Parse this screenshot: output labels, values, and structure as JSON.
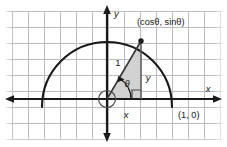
{
  "figure": {
    "type": "geometry-diagram",
    "background_color": "#ffffff",
    "grid": {
      "visible": true,
      "color": "#b9b9bd",
      "spacing_px": 16,
      "x_start_px": 12,
      "y_start_px": 11,
      "columns": 13,
      "rows": 8,
      "edge_fade": true
    },
    "axes": {
      "color": "#1a1a1a",
      "x_axis": {
        "label": "x",
        "y_px": 99,
        "x_from_px": 6,
        "x_to_px": 221,
        "arrow_left": true,
        "arrow_right": true,
        "label_x_px": 208,
        "label_y_px": 89
      },
      "y_axis": {
        "label": "y",
        "x_px": 107,
        "y_from_px": 6,
        "y_to_px": 141,
        "arrow_up": true,
        "arrow_down": true,
        "label_x_px": 113,
        "label_y_px": 14
      }
    },
    "semicircle": {
      "description": "upper half of the unit circle centered at the origin",
      "center_x_px": 107,
      "center_y_px": 99,
      "radius_px": 65,
      "stroke_color": "#1a1a1a",
      "stroke_width_px": 2,
      "overshoot_below_axis_px": 9
    },
    "origin_marker": {
      "shape": "small-circle",
      "center_x_px": 107,
      "center_y_px": 99,
      "radius_px": 9,
      "stroke_color": "#4a4a4a"
    },
    "triangle": {
      "description": "right triangle with hypotenuse of length 1 from origin to point on circle",
      "fill_color": "#d2d2d2",
      "stroke_color": "#4a4a4a",
      "vertices_px": [
        [
          107,
          99
        ],
        [
          141,
          99
        ],
        [
          141,
          41
        ]
      ],
      "angle_deg": 60
    },
    "point_on_circle": {
      "label": "(cosθ, sinθ)",
      "x_px": 141,
      "y_px": 41,
      "marker": "filled-dot",
      "marker_radius_px": 2.6,
      "label_x_px": 137,
      "label_y_px": 25
    },
    "x_intercept": {
      "label": "(1, 0)",
      "label_x_px": 178,
      "label_y_px": 115
    },
    "labels": {
      "hypotenuse": {
        "text": "1",
        "x_px": 118,
        "y_px": 63
      },
      "opposite_side": {
        "text": "y",
        "x_px": 148,
        "y_px": 78
      },
      "adjacent_side": {
        "text": "x",
        "x_px": 126,
        "y_px": 115
      },
      "angle": {
        "text": "θ",
        "x_px": 127,
        "y_px": 84
      }
    },
    "angle_arc": {
      "center_x_px": 107,
      "center_y_px": 99,
      "radius_px": 24,
      "stroke_color": "#1a1a1a"
    },
    "right_angle_marker": {
      "corner_x_px": 141,
      "corner_y_px": 99,
      "size_px": 9,
      "stroke_color": "#4a4a4a"
    }
  }
}
